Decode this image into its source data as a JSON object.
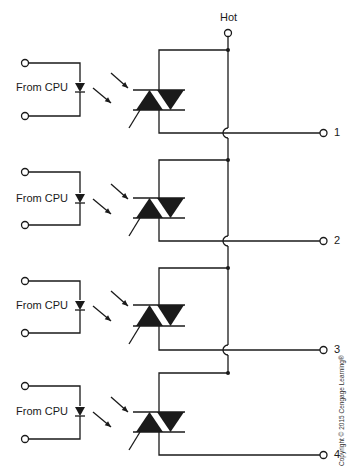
{
  "diagram": {
    "hot_label": "Hot",
    "copyright": "Copyright © 2015 Cengage Learning®",
    "stroke_color": "#1a1a1a",
    "channels": [
      {
        "input_label": "From CPU",
        "output_label": "1",
        "y_top": 50,
        "y_in1": 63,
        "y_in2": 116,
        "y_led": 88,
        "y_bar1": 90,
        "y_bar2": 110,
        "y_out": 133
      },
      {
        "input_label": "From CPU",
        "output_label": "2",
        "y_top": 160,
        "y_in1": 172,
        "y_in2": 225,
        "y_led": 199,
        "y_bar1": 198,
        "y_bar2": 218,
        "y_out": 241
      },
      {
        "input_label": "From CPU",
        "output_label": "3",
        "y_top": 268,
        "y_in1": 281,
        "y_in2": 333,
        "y_led": 306,
        "y_bar1": 305,
        "y_bar2": 326,
        "y_out": 350
      },
      {
        "input_label": "From CPU",
        "output_label": "4",
        "y_top": 373,
        "y_in1": 386,
        "y_in2": 439,
        "y_led": 412,
        "y_bar1": 412,
        "y_bar2": 432,
        "y_out": 455
      }
    ]
  }
}
